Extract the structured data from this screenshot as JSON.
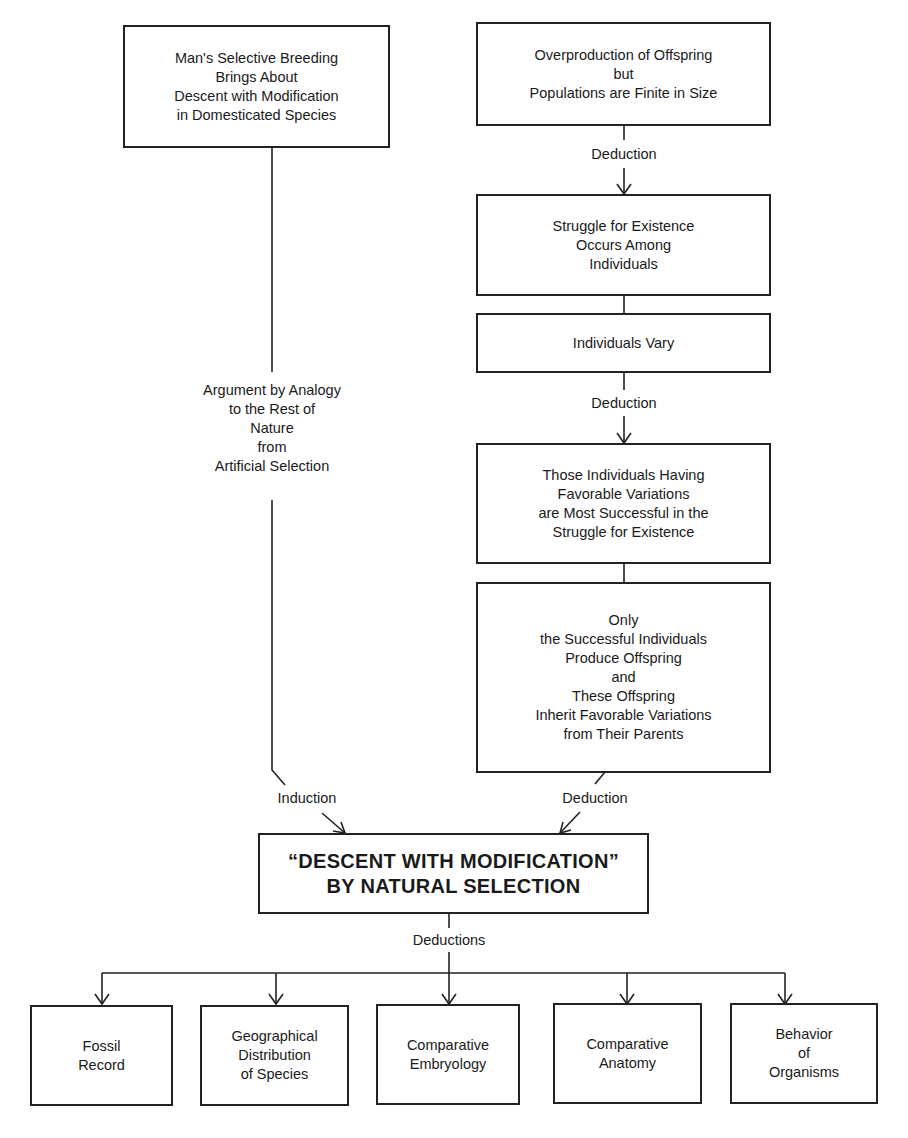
{
  "diagram": {
    "left_premise": {
      "lines": [
        "Man's Selective Breeding",
        "Brings About",
        "Descent with Modification",
        "in Domesticated Species"
      ]
    },
    "analogy_label": {
      "lines": [
        "Argument by Analogy",
        "to the Rest of",
        "Nature",
        "from",
        "Artificial Selection"
      ]
    },
    "right_chain": [
      {
        "id": "overproduction",
        "lines": [
          "Overproduction of Offspring",
          "but",
          "Populations are Finite in Size"
        ]
      },
      {
        "id": "struggle",
        "lines": [
          "Struggle for Existence",
          "Occurs Among",
          "Individuals"
        ]
      },
      {
        "id": "vary",
        "lines": [
          "Individuals Vary"
        ]
      },
      {
        "id": "favorable",
        "lines": [
          "Those Individuals Having",
          "Favorable Variations",
          "are Most Successful in the",
          "Struggle for Existence"
        ]
      },
      {
        "id": "inherit",
        "lines": [
          "Only",
          "the Successful Individuals",
          "Produce Offspring",
          "and",
          "These Offspring",
          "Inherit Favorable Variations",
          "from Their Parents"
        ]
      }
    ],
    "edge_labels": {
      "deduction_1": "Deduction",
      "deduction_2": "Deduction",
      "induction": "Induction",
      "deduction_3": "Deduction",
      "deductions": "Deductions"
    },
    "conclusion": {
      "lines": [
        "“DESCENT WITH MODIFICATION”",
        "BY NATURAL SELECTION"
      ]
    },
    "evidence": [
      {
        "lines": [
          "Fossil",
          "Record"
        ]
      },
      {
        "lines": [
          "Geographical",
          "Distribution",
          "of Species"
        ]
      },
      {
        "lines": [
          "Comparative",
          "Embryology"
        ]
      },
      {
        "lines": [
          "Comparative",
          "Anatomy"
        ]
      },
      {
        "lines": [
          "Behavior",
          "of",
          "Organisms"
        ]
      }
    ],
    "colors": {
      "ink": "#222222",
      "background": "#ffffff"
    }
  }
}
